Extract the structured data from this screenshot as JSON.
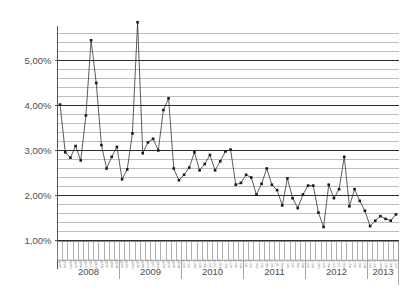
{
  "chart_data": {
    "type": "line",
    "title": "",
    "subtitle": "",
    "xlabel": "",
    "ylabel": "",
    "ylim": [
      1.0,
      5.9
    ],
    "ytick_values": [
      1.0,
      2.0,
      3.0,
      4.0,
      5.0
    ],
    "ytick_labels": [
      "1,00%",
      "2,00%",
      "3,00%",
      "4,00%",
      "5,00%"
    ],
    "grid": {
      "enabled": true,
      "minor_step": 0.2,
      "major_step": 1.0,
      "minor_color": "#9a9a9a",
      "major_color": "#2e2e2e"
    },
    "legend": {
      "position": "none",
      "entries": []
    },
    "marker": {
      "shape": "square",
      "color": "#1a1a1a",
      "size": 2.6
    },
    "line": {
      "color": "#333333",
      "width": 0.8
    },
    "axis_color": "#555555",
    "year_groups": [
      {
        "label": "2008",
        "months": 12
      },
      {
        "label": "2009",
        "months": 12
      },
      {
        "label": "2010",
        "months": 12
      },
      {
        "label": "2011",
        "months": 12
      },
      {
        "label": "2012",
        "months": 12
      },
      {
        "label": "2013",
        "months": 6
      }
    ],
    "month_tick_labels": [
      "jan 08",
      "feb 08",
      "mar 08",
      "apr 08",
      "mai 08",
      "jun 08",
      "jul 08",
      "aug 08",
      "sep 08",
      "okt 08",
      "nov 08",
      "des 08",
      "jan 09",
      "feb 09",
      "mar 09",
      "apr 09",
      "mai 09",
      "jun 09",
      "jul 09",
      "aug 09",
      "sep 09",
      "okt 09",
      "nov 09",
      "des 09",
      "jan 10",
      "feb 10",
      "mar 10",
      "apr 10",
      "mai 10",
      "jun 10",
      "jul 10",
      "aug 10",
      "sep 10",
      "okt 10",
      "nov 10",
      "des 10",
      "jan 11",
      "feb 11",
      "mar 11",
      "apr 11",
      "mai 11",
      "jun 11",
      "jul 11",
      "aug 11",
      "sep 11",
      "okt 11",
      "nov 11",
      "des 11",
      "jan 12",
      "feb 12",
      "mar 12",
      "apr 12",
      "mai 12",
      "jun 12",
      "jul 12",
      "aug 12",
      "sep 12",
      "okt 12",
      "nov 12",
      "des 12",
      "jan 13",
      "feb 13",
      "mar 13",
      "apr 13",
      "mai 13",
      "jun 13"
    ],
    "x": [
      "jan 08",
      "feb 08",
      "mar 08",
      "apr 08",
      "mai 08",
      "jun 08",
      "jul 08",
      "aug 08",
      "sep 08",
      "okt 08",
      "nov 08",
      "des 08",
      "jan 09",
      "feb 09",
      "mar 09",
      "apr 09",
      "mai 09",
      "jun 09",
      "jul 09",
      "aug 09",
      "sep 09",
      "okt 09",
      "nov 09",
      "des 09",
      "jan 10",
      "feb 10",
      "mar 10",
      "apr 10",
      "mai 10",
      "jun 10",
      "jul 10",
      "aug 10",
      "sep 10",
      "okt 10",
      "nov 10",
      "des 10",
      "jan 11",
      "feb 11",
      "mar 11",
      "apr 11",
      "mai 11",
      "jun 11",
      "jul 11",
      "aug 11",
      "sep 11",
      "okt 11",
      "nov 11",
      "des 11",
      "jan 12",
      "feb 12",
      "mar 12",
      "apr 12",
      "mai 12",
      "jun 12",
      "jul 12",
      "aug 12",
      "sep 12",
      "okt 12",
      "nov 12",
      "des 12",
      "jan 13",
      "feb 13",
      "mar 13",
      "apr 13",
      "mai 13",
      "jun 13"
    ],
    "values": [
      4.02,
      2.96,
      2.84,
      3.1,
      2.78,
      3.78,
      5.45,
      4.5,
      3.12,
      2.6,
      2.86,
      3.08,
      2.36,
      2.58,
      3.38,
      5.85,
      2.94,
      3.18,
      3.26,
      3.0,
      3.9,
      4.16,
      2.6,
      2.34,
      2.46,
      2.62,
      2.96,
      2.56,
      2.7,
      2.9,
      2.56,
      2.76,
      2.98,
      3.02,
      2.24,
      2.28,
      2.46,
      2.4,
      2.02,
      2.26,
      2.6,
      2.24,
      2.12,
      1.78,
      2.38,
      1.94,
      1.72,
      2.02,
      2.22,
      2.22,
      1.62,
      1.3,
      2.24,
      1.94,
      2.14,
      2.86,
      1.76,
      2.14,
      1.88,
      1.66,
      1.32,
      1.44,
      1.54,
      1.48,
      1.44,
      1.58
    ],
    "annotations": []
  }
}
